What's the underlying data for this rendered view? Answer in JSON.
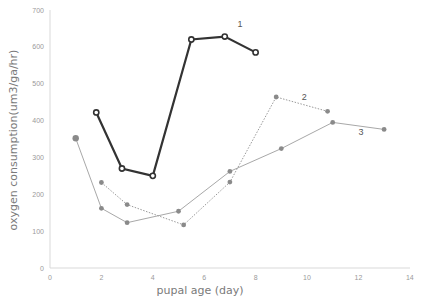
{
  "chart_data": {
    "type": "line",
    "title": "",
    "xlabel": "pupal   age (day)",
    "ylabel": "oxygen   consumption(um3/ga/hr)",
    "xlim": [
      0,
      14
    ],
    "ylim": [
      0,
      700
    ],
    "x_ticks": [
      "0",
      "2",
      "4",
      "6",
      "8",
      "10",
      "12",
      "14"
    ],
    "y_ticks": [
      "0",
      "100",
      "200",
      "300",
      "400",
      "500",
      "600",
      "700"
    ],
    "grid": false,
    "legend": "inline labels",
    "series": [
      {
        "name": "1",
        "style": "solid-dark-open-circles",
        "color": "#333333",
        "x": [
          1.8,
          2.8,
          4.0,
          5.5,
          6.8,
          8.0
        ],
        "values": [
          422,
          270,
          250,
          620,
          628,
          585
        ],
        "label_pos": {
          "x": 7.3,
          "y": 655
        }
      },
      {
        "name": "2",
        "style": "dotted-gray-filled-dots",
        "color": "#9a9a9a",
        "x": [
          2,
          3,
          5.2,
          7,
          8.8,
          10.8
        ],
        "values": [
          232,
          172,
          117,
          233,
          464,
          425
        ],
        "label_pos": {
          "x": 9.8,
          "y": 455
        }
      },
      {
        "name": "3",
        "style": "solid-light-gray-filled-dots",
        "color": "#a8a8a8",
        "x": [
          1,
          2,
          3,
          5,
          7,
          9,
          11,
          13
        ],
        "values": [
          352,
          162,
          123,
          154,
          262,
          324,
          395,
          376
        ],
        "label_pos": {
          "x": 12.0,
          "y": 362
        }
      }
    ]
  }
}
